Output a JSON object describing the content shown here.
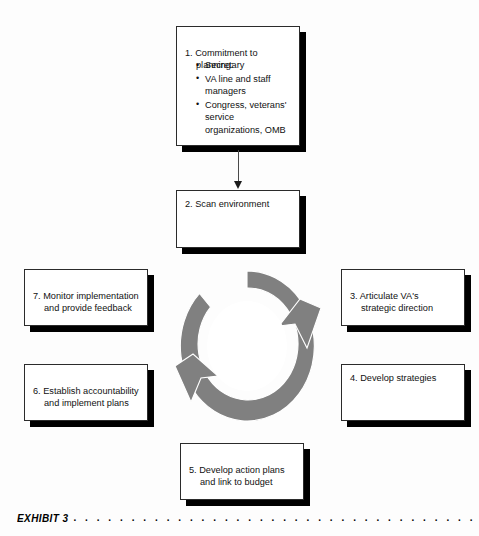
{
  "document": {
    "clipped_header_text": "",
    "background_color": "#fdfdfd"
  },
  "diagram": {
    "title": "",
    "type": "cycle-flowchart",
    "accent_gray": "#808080",
    "box_border_color": "#2b2b2b",
    "shadow_color": "#000000",
    "center_graphic": {
      "name": "circular-cycle-arrows",
      "description": "Gray annulus with two arrowheads indicating a clockwise continuous cycle",
      "fill": "#808080",
      "hole_fill": "#ffffff"
    },
    "steps": [
      {
        "id": "step-1",
        "number": "1.",
        "heading_line_1": "1. Commitment to",
        "heading_line_2": "planning:",
        "bullets": [
          "Secretary",
          "VA line and staff managers",
          "Congress, veterans' service organizations, OMB"
        ]
      },
      {
        "id": "step-2",
        "number": "2.",
        "text": "2. Scan environment",
        "bullets": []
      },
      {
        "id": "step-3",
        "number": "3.",
        "heading_line_1": "3. Articulate VA's",
        "heading_line_2": "strategic direction",
        "bullets": []
      },
      {
        "id": "step-4",
        "number": "4.",
        "text": "4. Develop strategies",
        "bullets": []
      },
      {
        "id": "step-5",
        "number": "5.",
        "heading_line_1": "5. Develop action plans",
        "heading_line_2": "and link to budget",
        "bullets": []
      },
      {
        "id": "step-6",
        "number": "6.",
        "heading_line_1": "6. Establish accountability",
        "heading_line_2": "and implement plans",
        "bullets": []
      },
      {
        "id": "step-7",
        "number": "7.",
        "heading_line_1": "7. Monitor implementation",
        "heading_line_2": "and provide feedback",
        "bullets": []
      }
    ],
    "connector": {
      "name": "arrow-step1-to-step2",
      "from": "step-1",
      "to": "step-2"
    }
  },
  "caption": {
    "label": "EXHIBIT 3",
    "leader": ". . . . . . . . . . . . . . . . . . . . . . . . . . . . . . . . . . . . . . . . . . . . . . . . . . . . . . . . . . . . . . . . . . . . . . . . . ."
  }
}
